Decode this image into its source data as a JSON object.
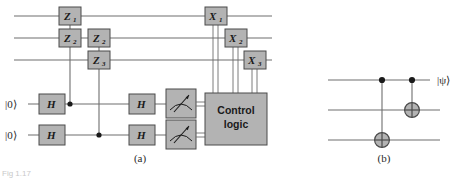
{
  "figure": {
    "background_color": "#ffffff",
    "wire_color": "#6e6e6e",
    "gate_fill": "#b3b3b3",
    "gate_stroke": "#4a4a4a",
    "text_color": "#1a1a1a",
    "bleed_fragment": "Fig 1.17"
  },
  "panel_a": {
    "caption": "(a)",
    "input_labels": [
      "|0⟩",
      "|0⟩"
    ],
    "hadamard_label": "H",
    "hadamard_gates": [
      {
        "name": "h-gate-q4-left",
        "label": "H"
      },
      {
        "name": "h-gate-q5-left",
        "label": "H"
      },
      {
        "name": "h-gate-q4-right",
        "label": "H"
      },
      {
        "name": "h-gate-q5-right",
        "label": "H"
      }
    ],
    "z_gates": [
      {
        "letter": "Z",
        "subscript": "1",
        "label": "Z1"
      },
      {
        "letter": "Z",
        "subscript": "2",
        "label": "Z2"
      },
      {
        "letter": "Z",
        "subscript": "2",
        "label": "Z2"
      },
      {
        "letter": "Z",
        "subscript": "3",
        "label": "Z3"
      }
    ],
    "x_gates": [
      {
        "letter": "X",
        "subscript": "1",
        "label": "X1"
      },
      {
        "letter": "X",
        "subscript": "2",
        "label": "X2"
      },
      {
        "letter": "X",
        "subscript": "3",
        "label": "X3"
      }
    ],
    "measurement_count": 2,
    "measurement_icon": "meter-gauge-icon",
    "control_logic": {
      "line1": "Control",
      "line2": "logic"
    },
    "wire_count_data": 3,
    "wire_count_ancilla": 2
  },
  "panel_b": {
    "caption": "(b)",
    "output_label": "|ψ⟩",
    "wire_count": 3,
    "cnot_gates": [
      {
        "name": "cnot-q1-to-q3",
        "control_wire": 1,
        "target_wire": 3
      },
      {
        "name": "cnot-q1-to-q2",
        "control_wire": 1,
        "target_wire": 2
      }
    ]
  }
}
